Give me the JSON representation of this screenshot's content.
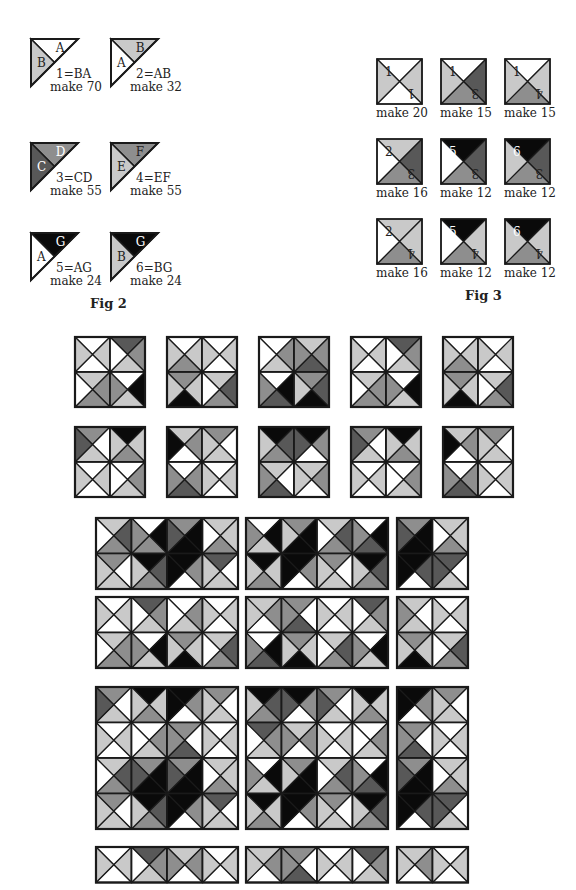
{
  "colors": {
    "W": "#ffffff",
    "L": "#c9c9c9",
    "M": "#8e8e8e",
    "D": "#585858",
    "K": "#0a0a0a",
    "line": "#1a1a1a"
  },
  "fig2": {
    "caption": "Fig 2",
    "units": [
      {
        "id": "1",
        "formula": "1=BA",
        "make": "make 70",
        "upper": "W",
        "lower": "L",
        "upper_letter": "A",
        "lower_letter": "B",
        "upper_letter_color": "#222",
        "lower_letter_color": "#222"
      },
      {
        "id": "2",
        "formula": "2=AB",
        "make": "make 32",
        "upper": "L",
        "lower": "W",
        "upper_letter": "B",
        "lower_letter": "A",
        "upper_letter_color": "#222",
        "lower_letter_color": "#222"
      },
      {
        "id": "3",
        "formula": "3=CD",
        "make": "make 55",
        "upper": "M",
        "lower": "D",
        "upper_letter": "D",
        "lower_letter": "C",
        "upper_letter_color": "#fff",
        "lower_letter_color": "#fff"
      },
      {
        "id": "4",
        "formula": "4=EF",
        "make": "make 55",
        "upper": "M",
        "lower": "L",
        "upper_letter": "F",
        "lower_letter": "E",
        "upper_letter_color": "#222",
        "lower_letter_color": "#222"
      },
      {
        "id": "5",
        "formula": "5=AG",
        "make": "make 24",
        "upper": "K",
        "lower": "W",
        "upper_letter": "G",
        "lower_letter": "A",
        "upper_letter_color": "#fff",
        "lower_letter_color": "#222"
      },
      {
        "id": "6",
        "formula": "6=BG",
        "make": "make 24",
        "upper": "K",
        "lower": "L",
        "upper_letter": "G",
        "lower_letter": "B",
        "upper_letter_color": "#fff",
        "lower_letter_color": "#222"
      }
    ]
  },
  "fig3": {
    "caption": "Fig 3",
    "squares": [
      {
        "tris": "WLWL",
        "nums": [
          "1",
          "1"
        ],
        "make": "make 20"
      },
      {
        "tris": "WDML",
        "nums": [
          "1",
          "3"
        ],
        "make": "make 15"
      },
      {
        "tris": "WLML",
        "nums": [
          "1",
          "4"
        ],
        "make": "make 15"
      },
      {
        "tris": "LDMW",
        "nums": [
          "2",
          "3"
        ],
        "make": "make 16"
      },
      {
        "tris": "KDMW",
        "nums": [
          "5",
          "3"
        ],
        "make": "make 12"
      },
      {
        "tris": "KDML",
        "nums": [
          "6",
          "3"
        ],
        "make": "make 12"
      },
      {
        "tris": "LLMW",
        "nums": [
          "2",
          "4"
        ],
        "make": "make 16"
      },
      {
        "tris": "KLMW",
        "nums": [
          "5",
          "4"
        ],
        "make": "make 12"
      },
      {
        "tris": "KLML",
        "nums": [
          "6",
          "4"
        ],
        "make": "make 12"
      }
    ]
  },
  "small_blocks": [
    {
      "x": 74,
      "y": 336,
      "rows": [
        [
          "WLWL",
          "DMLW"
        ],
        [
          "LMMW",
          "WKLM"
        ]
      ]
    },
    {
      "x": 166,
      "y": 336,
      "rows": [
        [
          "WLML",
          "WLWL"
        ],
        [
          "MLKL",
          "LDMW"
        ]
      ]
    },
    {
      "x": 258,
      "y": 336,
      "rows": [
        [
          "WMLW",
          "LMDM"
        ],
        [
          "WKDM",
          "MDKL"
        ]
      ]
    },
    {
      "x": 350,
      "y": 336,
      "rows": [
        [
          "WLWL",
          "DMLW"
        ],
        [
          "LMMW",
          "WKLM"
        ]
      ]
    },
    {
      "x": 442,
      "y": 336,
      "rows": [
        [
          "WLML",
          "WLWL"
        ],
        [
          "MLKL",
          "LDMW"
        ]
      ]
    },
    {
      "x": 74,
      "y": 426,
      "rows": [
        [
          "MWLD",
          "KLML"
        ],
        [
          "WLWL",
          "WMLW"
        ]
      ]
    },
    {
      "x": 166,
      "y": 426,
      "rows": [
        [
          "LMWK",
          "MWLL"
        ],
        [
          "WMDM",
          "WLWL"
        ]
      ]
    },
    {
      "x": 258,
      "y": 426,
      "rows": [
        [
          "KDML",
          "KMWD"
        ],
        [
          "LWDM",
          "LMWL"
        ]
      ]
    },
    {
      "x": 350,
      "y": 426,
      "rows": [
        [
          "MWLD",
          "KLML"
        ],
        [
          "WLWL",
          "WMLW"
        ]
      ]
    },
    {
      "x": 442,
      "y": 426,
      "rows": [
        [
          "LMWK",
          "MWLL"
        ],
        [
          "WMDM",
          "WLWL"
        ]
      ]
    }
  ],
  "quilt_blocks": [
    {
      "x": 95,
      "y": 517,
      "rows": [
        [
          "LDMW",
          "WKMM",
          "MKKD",
          "LLMW"
        ],
        [
          "MWLL",
          "KDML",
          "KMWK",
          "DWLL"
        ]
      ]
    },
    {
      "x": 245,
      "y": 517,
      "rows": [
        [
          "WKLM",
          "MKKL",
          "LDMW",
          "WKDM"
        ],
        [
          "KLML",
          "KMWK",
          "MWLL",
          "KDML"
        ]
      ]
    },
    {
      "x": 396,
      "y": 517,
      "rows": [
        [
          "MKKD",
          "LLMW"
        ],
        [
          "KDWK",
          "DWLD"
        ]
      ]
    },
    {
      "x": 95,
      "y": 596,
      "rows": [
        [
          "WLWL",
          "DMLW",
          "WMLW",
          "WLWL"
        ],
        [
          "LMMW",
          "WKLM",
          "MLKL",
          "LDMW"
        ]
      ]
    },
    {
      "x": 245,
      "y": 596,
      "rows": [
        [
          "LMWL",
          "MWDM",
          "WLWL",
          "DMLW"
        ],
        [
          "WKDM",
          "MLKL",
          "LDMW",
          "WKLM"
        ]
      ]
    },
    {
      "x": 396,
      "y": 596,
      "rows": [
        [
          "LWLM",
          "WLWL"
        ],
        [
          "MLKL",
          "LDMW"
        ]
      ]
    },
    {
      "x": 95,
      "y": 686,
      "rows": [
        [
          "MWLD",
          "KLML",
          "KMWK",
          "MWLL"
        ],
        [
          "WLWL",
          "WMLW",
          "MWDM",
          "WLWL"
        ],
        [
          "LDMW",
          "MKKD",
          "MKKD",
          "LLMW"
        ],
        [
          "MWLL",
          "KDML",
          "KMWK",
          "DWLL"
        ]
      ]
    },
    {
      "x": 245,
      "y": 686,
      "rows": [
        [
          "KDML",
          "KMWD",
          "MWLD",
          "KLML"
        ],
        [
          "DMLW",
          "LMWM",
          "WLWL",
          "WMLW"
        ],
        [
          "WKLM",
          "MKKL",
          "LDMW",
          "WKDM"
        ],
        [
          "KLML",
          "KMWK",
          "MWLL",
          "KDML"
        ]
      ]
    },
    {
      "x": 396,
      "y": 686,
      "rows": [
        [
          "KMWK",
          "MWLL"
        ],
        [
          "MWDM",
          "WLWL"
        ],
        [
          "MKKD",
          "LLMW"
        ],
        [
          "KDWK",
          "DWLD"
        ]
      ]
    },
    {
      "x": 95,
      "y": 846,
      "rows": [
        [
          "WLWL",
          "DMLW",
          "LMWM",
          "WLWL"
        ]
      ]
    },
    {
      "x": 245,
      "y": 846,
      "rows": [
        [
          "LMWL",
          "MWDM",
          "WLWL",
          "DMLW"
        ]
      ]
    },
    {
      "x": 396,
      "y": 846,
      "rows": [
        [
          "LMWL",
          "WLWL"
        ]
      ]
    }
  ]
}
